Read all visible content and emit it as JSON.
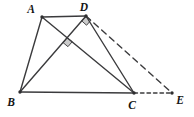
{
  "figure": {
    "kind": "geometry-diagram",
    "canvas": {
      "width": 194,
      "height": 117
    },
    "colors": {
      "background": "#ffffff",
      "line": "#3b3b3d",
      "vertex_dot": "#2e2e30",
      "marker_fill": "#cbcbcb",
      "marker_border": "#4a4a4c",
      "label": "#141414"
    },
    "label_font_size": 11.5,
    "line_width": 1.4,
    "dot_radius": 1.7,
    "points": {
      "A": {
        "x": 42,
        "y": 17,
        "label": "A",
        "label_x": 31,
        "label_y": 13,
        "dot": true
      },
      "D": {
        "x": 86,
        "y": 16,
        "label": "D",
        "label_x": 84,
        "label_y": 11,
        "dot": true
      },
      "B": {
        "x": 20,
        "y": 92,
        "label": "B",
        "label_x": 11,
        "label_y": 106,
        "dot": true
      },
      "C": {
        "x": 134,
        "y": 93,
        "label": "C",
        "label_x": 132,
        "label_y": 109,
        "dot": true
      },
      "E": {
        "x": 172,
        "y": 93,
        "label": "E",
        "label_x": 180,
        "label_y": 104,
        "dot": true
      },
      "O": {
        "x": 67.2,
        "y": 37.6,
        "label": "",
        "label_x": 0,
        "label_y": 0,
        "dot": false
      }
    },
    "segments": [
      {
        "id": "AD",
        "from": "A",
        "to": "D",
        "style": "solid",
        "dash": ""
      },
      {
        "id": "AB",
        "from": "A",
        "to": "B",
        "style": "solid",
        "dash": ""
      },
      {
        "id": "BC",
        "from": "B",
        "to": "C",
        "style": "solid",
        "dash": ""
      },
      {
        "id": "DC",
        "from": "D",
        "to": "C",
        "style": "solid",
        "dash": ""
      },
      {
        "id": "AC",
        "from": "A",
        "to": "C",
        "style": "solid",
        "dash": ""
      },
      {
        "id": "BD",
        "from": "B",
        "to": "D",
        "style": "solid",
        "dash": ""
      },
      {
        "id": "DE",
        "from": "D",
        "to": "E",
        "style": "dashed",
        "dash": "6 4.5"
      },
      {
        "id": "CE",
        "from": "C",
        "to": "E",
        "style": "dashed",
        "dash": "3.5 3"
      }
    ],
    "right_angle_markers": [
      {
        "id": "right-angle-marker-at-intersection",
        "vertex": "O",
        "ray1": "C",
        "ray2": "B",
        "size": 6.5
      },
      {
        "id": "right-angle-marker-at-D",
        "vertex": "D",
        "ray1": "E",
        "ray2": "B",
        "size": 6.5
      }
    ]
  }
}
